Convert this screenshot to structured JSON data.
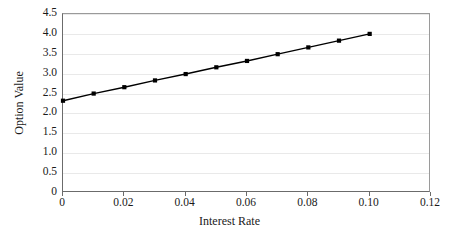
{
  "chart_data": {
    "type": "line",
    "title": "",
    "xlabel": "Interest Rate",
    "ylabel": "Option Value",
    "xlim": [
      0,
      0.12
    ],
    "ylim": [
      0,
      4.5
    ],
    "grid": true,
    "legend": false,
    "marker": "square",
    "line_color": "#000000",
    "marker_color": "#000000",
    "gridline_color": "#e9e9e9",
    "axis_color": "#6b6b6b",
    "background_color": "#ffffff",
    "xticks": [
      0,
      0.02,
      0.04,
      0.06,
      0.08,
      0.1,
      0.12
    ],
    "xtick_labels": [
      "0",
      "0.02",
      "0.04",
      "0.06",
      "0.08",
      "0.10",
      "0.12"
    ],
    "yticks": [
      0,
      0.5,
      1.0,
      1.5,
      2.0,
      2.5,
      3.0,
      3.5,
      4.0,
      4.5
    ],
    "ytick_labels": [
      "0",
      "0.5",
      "1.0",
      "1.5",
      "2.0",
      "2.5",
      "3.0",
      "3.5",
      "4.0",
      "4.5"
    ],
    "x": [
      0,
      0.01,
      0.02,
      0.03,
      0.04,
      0.05,
      0.06,
      0.07,
      0.08,
      0.09,
      0.1
    ],
    "values": [
      2.32,
      2.5,
      2.66,
      2.83,
      2.99,
      3.16,
      3.32,
      3.49,
      3.66,
      3.83,
      4.0
    ],
    "series": [
      {
        "name": "Option Value",
        "values": [
          2.32,
          2.5,
          2.66,
          2.83,
          2.99,
          3.16,
          3.32,
          3.49,
          3.66,
          3.83,
          4.0
        ]
      }
    ]
  }
}
